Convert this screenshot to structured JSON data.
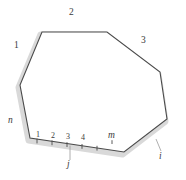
{
  "figure": {
    "type": "polygon-diagram",
    "colors": {
      "outline": "#4a4a4a",
      "band": "#d9d9d9",
      "background": "#ffffff",
      "text": "#3b3b3b"
    },
    "vertices": [
      {
        "x": 42,
        "y": 32
      },
      {
        "x": 107,
        "y": 32
      },
      {
        "x": 160,
        "y": 72
      },
      {
        "x": 167,
        "y": 119
      },
      {
        "x": 124,
        "y": 152
      },
      {
        "x": 30,
        "y": 138
      },
      {
        "x": 20,
        "y": 85
      }
    ]
  },
  "labels": {
    "edge_top": "2",
    "edge_upper_left": "1",
    "edge_upper_right": "3",
    "edge_left": "n",
    "edge_lower_right": "i",
    "edge_bottom": "j",
    "vertex_right_of_base": "m"
  },
  "base_ticks": [
    {
      "label": "1",
      "x": 36,
      "y": 131
    },
    {
      "label": "2",
      "x": 51,
      "y": 131
    },
    {
      "label": "3",
      "x": 66,
      "y": 131
    },
    {
      "label": "4",
      "x": 81,
      "y": 131
    }
  ]
}
